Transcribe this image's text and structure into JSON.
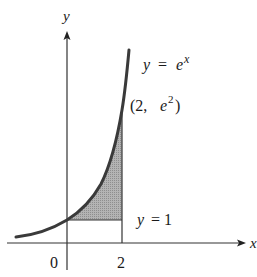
{
  "diagram": {
    "type": "region-under-curve",
    "axes": {
      "x_label": "x",
      "y_label": "y",
      "x_ticks": [
        "0",
        "2"
      ]
    },
    "curve": {
      "label_lhs": "y",
      "label_eq": "=",
      "label_base": "e",
      "label_exp": "x"
    },
    "point": {
      "open": "(2,",
      "base": "e",
      "exp": "2",
      "close": ")"
    },
    "line": {
      "label_lhs": "y",
      "label_rhs": "= 1"
    },
    "colors": {
      "curve": "#3a3a3a",
      "axes": "#333333",
      "shade": "#a8a8a8"
    }
  }
}
